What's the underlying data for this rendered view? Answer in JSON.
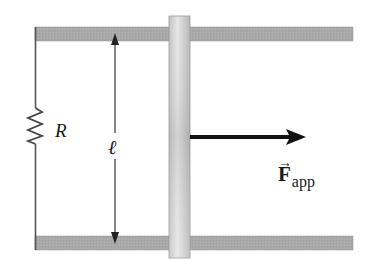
{
  "diagram": {
    "type": "physics-circuit",
    "labels": {
      "resistor": "R",
      "length": "ℓ",
      "force_symbol": "F",
      "force_vector_mark": "⃗",
      "force_subscript": "app"
    },
    "colors": {
      "rail_fill": "#a8a8a8",
      "rail_stroke": "#8c8c8c",
      "bar_light": "#e4e4e4",
      "bar_dark": "#b4b4b4",
      "wire": "#555555",
      "arrow": "#111111",
      "text": "#1a1a1a"
    },
    "elements": {
      "top_rail": {
        "x": 35,
        "y": 27,
        "width": 318,
        "height": 14
      },
      "bottom_rail": {
        "x": 35,
        "y": 236,
        "width": 318,
        "height": 14
      },
      "sliding_bar": {
        "x": 169,
        "y": 16,
        "width": 21,
        "height": 242
      },
      "left_wire": {
        "x": 35,
        "y1": 27,
        "y2": 250
      },
      "resistor_zigzag": {
        "x": 35,
        "y_start": 108,
        "y_end": 144
      },
      "length_arrow": {
        "x": 115,
        "y_top": 33,
        "y_bottom": 244
      },
      "force_arrow": {
        "x_start": 190,
        "x_end": 305,
        "y": 137
      }
    }
  }
}
